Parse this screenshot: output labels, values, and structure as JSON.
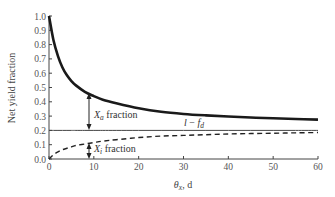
{
  "chart_data": {
    "type": "line",
    "title": "",
    "xlabel": "θx, d",
    "ylabel": "Net yield fraction",
    "xlim": [
      0,
      60
    ],
    "ylim": [
      0,
      1.0
    ],
    "xticks": [
      "0",
      "10",
      "20",
      "30",
      "40",
      "50",
      "60"
    ],
    "yticks": [
      "0.0",
      "0.1",
      "0.2",
      "0.3",
      "0.4",
      "0.5",
      "0.6",
      "0.7",
      "0.8",
      "0.9",
      "1.0"
    ],
    "grid": false,
    "legend": null,
    "x": [
      0,
      1,
      2,
      3,
      4,
      5,
      6,
      8,
      10,
      12,
      15,
      20,
      25,
      30,
      35,
      40,
      45,
      50,
      55,
      60
    ],
    "series": [
      {
        "name": "Total net yield fraction (Xa + Xi)",
        "style": "solid-thick",
        "values": [
          1.0,
          0.83,
          0.72,
          0.64,
          0.585,
          0.545,
          0.515,
          0.47,
          0.44,
          0.415,
          0.39,
          0.355,
          0.33,
          0.315,
          0.305,
          0.297,
          0.29,
          0.285,
          0.28,
          0.275
        ]
      },
      {
        "name": "1 - fd",
        "style": "solid-thin",
        "values": [
          0.2,
          0.2,
          0.2,
          0.2,
          0.2,
          0.2,
          0.2,
          0.2,
          0.2,
          0.2,
          0.2,
          0.2,
          0.2,
          0.2,
          0.2,
          0.2,
          0.2,
          0.2,
          0.2,
          0.2
        ]
      },
      {
        "name": "Xi fraction",
        "style": "dashed",
        "values": [
          0.0,
          0.03,
          0.05,
          0.065,
          0.075,
          0.085,
          0.095,
          0.105,
          0.115,
          0.125,
          0.135,
          0.15,
          0.16,
          0.165,
          0.17,
          0.175,
          0.178,
          0.18,
          0.183,
          0.185
        ]
      }
    ],
    "annotations": [
      {
        "text": "Xa fraction",
        "x": 9,
        "range": [
          0.2,
          0.46
        ],
        "note": "double-headed arrow between 1-fd line and top curve"
      },
      {
        "text": "Xi fraction",
        "x": 9,
        "range": [
          0.0,
          0.11
        ],
        "note": "double-headed arrow between x-axis and dashed curve"
      },
      {
        "text": "1 - fd",
        "x": 33,
        "y": 0.22,
        "note": "label for horizontal line"
      }
    ]
  },
  "labels": {
    "ylabel": "Net yield fraction",
    "xlabel_symbol": "θ",
    "xlabel_sub": "x",
    "xlabel_unit": ", d",
    "xa_symbol": "X",
    "xa_sub": "a",
    "xa_text": " fraction",
    "xi_symbol": "X",
    "xi_sub": "i",
    "xi_text": " fraction",
    "line_label_1": "l",
    "line_label_minus": " − ",
    "line_label_f": "f",
    "line_label_sub": "d"
  }
}
